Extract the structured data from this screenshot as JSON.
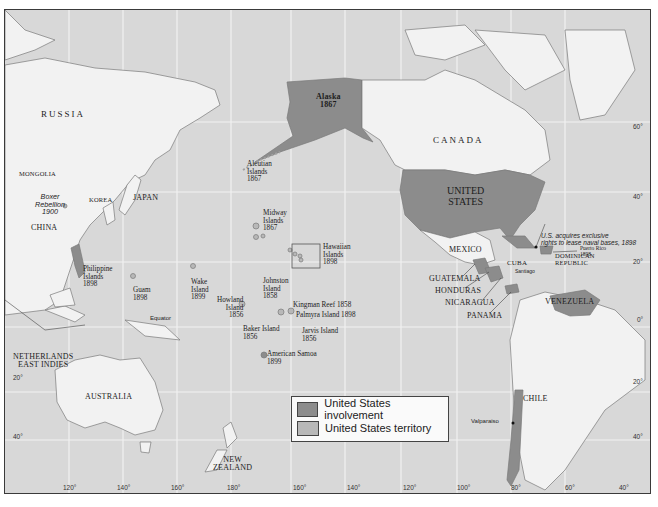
{
  "colors": {
    "ocean": "#d8d8d8",
    "land": "#f2f2f2",
    "involvement": "#8c8c8c",
    "territory": "#b8b8b8",
    "grid": "#f4f4f4",
    "border": "#6e6e6e"
  },
  "labels": {
    "russia": "RUSSIA",
    "canada": "CANADA",
    "alaska": "Alaska",
    "alaska_year": "1867",
    "aleutian": "Aleutian",
    "aleutian2": "Islands",
    "aleutian_year": "1867",
    "mongolia": "MONGOLIA",
    "boxer": "Boxer",
    "boxer2": "Rebellion",
    "boxer_year": "1900",
    "korea": "KOREA",
    "japan": "JAPAN",
    "china": "CHINA",
    "midway": "Midway",
    "midway2": "Islands",
    "midway_year": "1867",
    "united": "UNITED",
    "states": "STATES",
    "philippine": "Philippine",
    "philippine2": "Islands",
    "philippine_year": "1898",
    "guam": "Guam",
    "guam_year": "1898",
    "wake": "Wake",
    "wake2": "Island",
    "wake_year": "1899",
    "johnston": "Johnston",
    "johnston2": "Island",
    "johnston_year": "1858",
    "hawaiian": "Hawaiian",
    "hawaiian2": "Islands",
    "hawaiian_year": "1898",
    "howland": "Howland",
    "howland2": "Island",
    "howland_year": "1856",
    "kingman": "Kingman Reef 1858",
    "palmyra": "Palmyra Island 1898",
    "baker": "Baker Island",
    "baker_year": "1856",
    "jarvis": "Jarvis Island",
    "jarvis_year": "1856",
    "samoa": "American Samoa",
    "samoa_year": "1899",
    "equator": "Equator",
    "mexico": "MEXICO",
    "cuba": "CUBA",
    "santiago": "Santiago",
    "naval1": "U.S. acquires exclusive",
    "naval2": "rights to lease naval bases, 1898",
    "dominican": "DOMINICAN",
    "dominican2": "REPUBLIC",
    "puerto_rico": "Puerto Rico",
    "puerto_rico_year": "1898",
    "guatemala": "GUATEMALA",
    "honduras": "HONDURAS",
    "nicaragua": "NICARAGUA",
    "panama": "PANAMA",
    "venezuela": "VENEZUELA",
    "netherlands": "NETHERLANDS",
    "east_indies": "EAST INDIES",
    "australia": "AUSTRALIA",
    "new": "NEW",
    "zealand": "ZEALAND",
    "chile": "CHILE",
    "valparaiso": "Valparaiso"
  },
  "axis": {
    "bottom": [
      "120°",
      "140°",
      "160°",
      "180°",
      "160°",
      "140°",
      "120°",
      "100°",
      "80°",
      "60°",
      "40°"
    ],
    "right": [
      "60°",
      "40°",
      "20°",
      "0°",
      "20°",
      "40°"
    ],
    "left": [
      "20°",
      "40°"
    ]
  },
  "legend": {
    "items": [
      {
        "label": "United States involvement"
      },
      {
        "label": "United States territory"
      }
    ]
  }
}
